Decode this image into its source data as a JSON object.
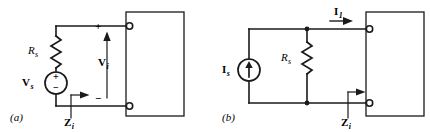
{
  "figure": {
    "stroke_color": "#1a1a1a",
    "text_color": "#000000",
    "background": "#ffffff"
  },
  "panels": [
    {
      "id": "a",
      "caption": "(a)",
      "source_type": "voltage-source",
      "source_label": {
        "symbol": "V",
        "subscript": "s"
      },
      "resistor_label": {
        "symbol": "R",
        "subscript": "s"
      },
      "port_voltage_label": {
        "symbol": "V",
        "subscript": "i"
      },
      "impedance_label": {
        "symbol": "Z",
        "subscript": "i"
      },
      "polarity_plus": "+",
      "polarity_minus": "−",
      "source_plus": "+",
      "source_minus": "−"
    },
    {
      "id": "b",
      "caption": "(b)",
      "source_type": "current-source",
      "source_label": {
        "symbol": "I",
        "subscript": "s"
      },
      "resistor_label": {
        "symbol": "R",
        "subscript": "s"
      },
      "port_current_label": {
        "symbol": "I",
        "subscript": "1"
      },
      "impedance_label": {
        "symbol": "Z",
        "subscript": "i"
      }
    }
  ]
}
